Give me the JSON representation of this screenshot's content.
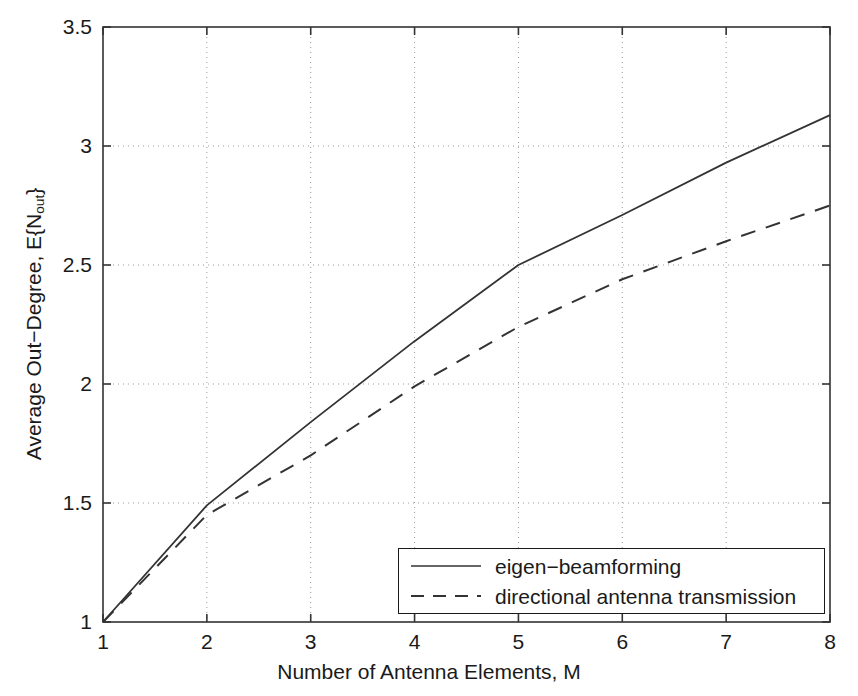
{
  "chart_data": {
    "type": "line",
    "title": "",
    "xlabel": "Number of Antenna Elements, M",
    "ylabel_main": "Average Out−Degree, E{N",
    "ylabel_sub": "out",
    "ylabel_tail": "}",
    "ylabel_plain": "Average Out−Degree, E{N_out}",
    "x": [
      1,
      2,
      3,
      4,
      5,
      6,
      7,
      8
    ],
    "xlim": [
      1,
      8
    ],
    "ylim": [
      1,
      3.5
    ],
    "xticks": [
      1,
      2,
      3,
      4,
      5,
      6,
      7,
      8
    ],
    "xtick_labels": [
      "1",
      "2",
      "3",
      "4",
      "5",
      "6",
      "7",
      "8"
    ],
    "yticks": [
      1,
      1.5,
      2,
      2.5,
      3,
      3.5
    ],
    "ytick_labels": [
      "1",
      "1.5",
      "2",
      "2.5",
      "3",
      "3.5"
    ],
    "grid": true,
    "grid_style": "dotted",
    "legend_position": "lower right",
    "series": [
      {
        "name": "eigen−beamforming",
        "style": "solid",
        "color": "#333333",
        "values": [
          1.0,
          1.49,
          1.84,
          2.18,
          2.5,
          2.71,
          2.93,
          3.13
        ]
      },
      {
        "name": "directional antenna transmission",
        "style": "dashed",
        "color": "#333333",
        "values": [
          1.0,
          1.45,
          1.7,
          1.99,
          2.24,
          2.44,
          2.6,
          2.75
        ]
      }
    ]
  },
  "axis": {
    "frame_color": "#333333",
    "grid_color": "#9a9a9a",
    "background": "#ffffff"
  }
}
